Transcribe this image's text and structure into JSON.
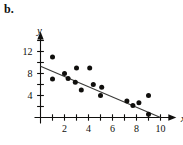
{
  "figure": {
    "panel_label": "b.",
    "background_color": "#ffffff",
    "ink_color": "#100f0d",
    "trendline_color": "#3a3a38"
  },
  "chart_data": {
    "type": "scatter",
    "title": "",
    "subtitle": "",
    "xlabel": "x",
    "ylabel": "y",
    "xlim": [
      0,
      11
    ],
    "ylim": [
      0,
      14
    ],
    "xticks": [
      1,
      2,
      3,
      4,
      5,
      6,
      7,
      8,
      9,
      10
    ],
    "xtick_labels": [
      "",
      "2",
      "",
      "4",
      "",
      "6",
      "",
      "8",
      "",
      "10"
    ],
    "yticks": [
      2,
      4,
      6,
      8,
      10,
      12,
      14
    ],
    "ytick_labels": [
      "",
      "4",
      "",
      "8",
      "",
      "12",
      ""
    ],
    "grid": false,
    "legend": null,
    "annotations": [],
    "points": [
      {
        "x": 1.0,
        "y": 11.0
      },
      {
        "x": 1.0,
        "y": 7.0
      },
      {
        "x": 2.0,
        "y": 8.0
      },
      {
        "x": 2.3,
        "y": 7.1
      },
      {
        "x": 3.0,
        "y": 9.0
      },
      {
        "x": 2.9,
        "y": 6.4
      },
      {
        "x": 3.4,
        "y": 5.0
      },
      {
        "x": 4.1,
        "y": 9.0
      },
      {
        "x": 4.4,
        "y": 6.0
      },
      {
        "x": 5.1,
        "y": 5.5
      },
      {
        "x": 5.0,
        "y": 4.0
      },
      {
        "x": 7.2,
        "y": 3.0
      },
      {
        "x": 7.7,
        "y": 2.2
      },
      {
        "x": 8.2,
        "y": 2.7
      },
      {
        "x": 9.0,
        "y": 4.0
      },
      {
        "x": 9.0,
        "y": 0.6
      }
    ],
    "series": [
      {
        "name": "data",
        "marker": "filled-circle",
        "x": [
          1.0,
          1.0,
          2.0,
          2.3,
          3.0,
          2.9,
          3.4,
          4.1,
          4.4,
          5.1,
          5.0,
          7.2,
          7.7,
          8.2,
          9.0,
          9.0
        ],
        "values": [
          11.0,
          7.0,
          8.0,
          7.1,
          9.0,
          6.4,
          5.0,
          9.0,
          6.0,
          5.5,
          4.0,
          3.0,
          2.2,
          2.7,
          4.0,
          0.6
        ]
      }
    ],
    "trendline": {
      "type": "line",
      "x": [
        0,
        10
      ],
      "values": [
        9.3,
        0.0
      ],
      "slope": -0.93,
      "intercept": 9.3
    }
  }
}
